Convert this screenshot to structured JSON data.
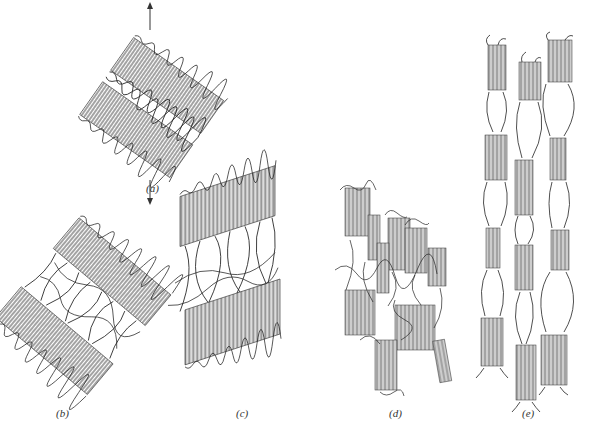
{
  "figure": {
    "panels": [
      {
        "id": "a",
        "label": "(a)",
        "description": "Two lamellar stacks tilted, with tensile arrows above and below",
        "label_pos": [
          150,
          190
        ]
      },
      {
        "id": "b",
        "label": "(b)",
        "description": "Lamellae separating with stretched amorphous tie chains",
        "label_pos": [
          63,
          413
        ]
      },
      {
        "id": "c",
        "label": "(c)",
        "description": "Lamellae tilting toward draw direction, interlamellar region extended",
        "label_pos": [
          243,
          413
        ]
      },
      {
        "id": "d",
        "label": "(d)",
        "description": "Lamellae fragmenting into crystalline blocks",
        "label_pos": [
          395,
          413
        ]
      },
      {
        "id": "e",
        "label": "(e)",
        "description": "Blocks aligned into microfibrils along draw axis",
        "label_pos": [
          529,
          413
        ]
      }
    ],
    "arrows": [
      {
        "name": "tensile-arrow-up",
        "x": 150,
        "y1": 30,
        "y2": 4
      },
      {
        "name": "tensile-arrow-down",
        "x": 150,
        "y1": 180,
        "y2": 204
      }
    ],
    "colors": {
      "line": "#2a2a2a",
      "background": "#ffffff"
    }
  }
}
